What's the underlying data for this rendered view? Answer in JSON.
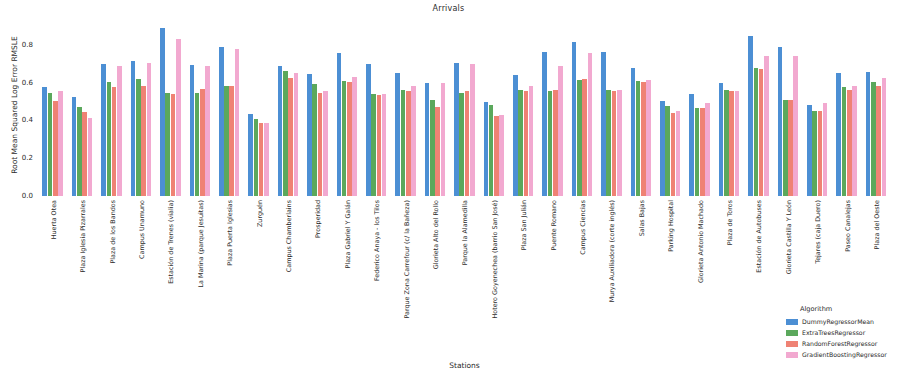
{
  "chart_data": {
    "type": "bar",
    "title": "Arrivals",
    "xlabel": "Stations",
    "ylabel": "Root Mean Squared Log Error RMSLE",
    "ylim": [
      0.0,
      0.92
    ],
    "yticks": [
      0.0,
      0.2,
      0.4,
      0.6,
      0.8
    ],
    "ytick_labels": [
      "0.0",
      "0.2",
      "0.4",
      "0.6",
      "0.8"
    ],
    "grid": false,
    "legend_title": "Algorithm",
    "legend_position": "lower right outside",
    "categories": [
      "Huerta Otea",
      "Plaza Iglesia Pizarrales",
      "Plaza de los Bandos",
      "Campus Unamuno",
      "Estación de Trenes (vialia)",
      "La Marina (parque Jesuitas)",
      "Plaza Puerta Iglesias",
      "Zurguén",
      "Campus Chamberlains",
      "Prosperidad",
      "Plaza Gabriel Y Galán",
      "Federico Anaya - los Tilos",
      "Parque Zona Carrefour (c/ la Bañeza)",
      "Glorieta Alto del Rollo",
      "Parque la Alamedilla",
      "Hotero Goyenechea (barrio San José)",
      "Plaza San Julián",
      "Puente Romano",
      "Campus Ciencias",
      "Murya Auxiliadora (corte inglés)",
      "Salas Bajas",
      "Parking Hospital",
      "Glorieta Antonio Machado",
      "Plaza de Toros",
      "Estación de Autobuses",
      "Glorieta Castilla Y León",
      "Tejares (caja Duero)",
      "Paseo Canalejas",
      "Plaza del Oeste"
    ],
    "series": [
      {
        "name": "DummyRegressorMean",
        "color": "#4c8fd4",
        "values": [
          0.575,
          0.525,
          0.7,
          0.715,
          0.89,
          0.695,
          0.79,
          0.435,
          0.69,
          0.645,
          0.755,
          0.7,
          0.65,
          0.6,
          0.705,
          0.495,
          0.64,
          0.76,
          0.815,
          0.76,
          0.675,
          0.505,
          0.54,
          0.6,
          0.845,
          0.79,
          0.48,
          0.65,
          0.655
        ]
      },
      {
        "name": "ExtraTreesRegressor",
        "color": "#5ba85c",
        "values": [
          0.545,
          0.47,
          0.605,
          0.62,
          0.545,
          0.545,
          0.58,
          0.405,
          0.66,
          0.59,
          0.61,
          0.54,
          0.56,
          0.51,
          0.545,
          0.48,
          0.56,
          0.555,
          0.615,
          0.56,
          0.61,
          0.475,
          0.465,
          0.56,
          0.675,
          0.51,
          0.45,
          0.575,
          0.605
        ]
      },
      {
        "name": "RandomForestRegressor",
        "color": "#ef8274",
        "values": [
          0.505,
          0.445,
          0.575,
          0.58,
          0.54,
          0.565,
          0.58,
          0.385,
          0.625,
          0.545,
          0.605,
          0.535,
          0.555,
          0.47,
          0.555,
          0.425,
          0.555,
          0.56,
          0.62,
          0.555,
          0.605,
          0.44,
          0.465,
          0.555,
          0.67,
          0.51,
          0.45,
          0.56,
          0.58
        ]
      },
      {
        "name": "GradientBoostingRegressor",
        "color": "#f2a9d0",
        "values": [
          0.555,
          0.415,
          0.685,
          0.705,
          0.83,
          0.685,
          0.775,
          0.385,
          0.65,
          0.555,
          0.63,
          0.54,
          0.58,
          0.6,
          0.7,
          0.43,
          0.58,
          0.69,
          0.755,
          0.56,
          0.615,
          0.45,
          0.49,
          0.555,
          0.74,
          0.74,
          0.49,
          0.58,
          0.625
        ]
      }
    ]
  }
}
